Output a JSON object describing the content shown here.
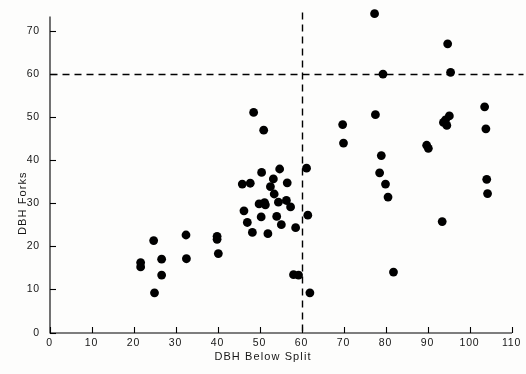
{
  "figure": {
    "background": "#fdfdfc",
    "ink": "#000000",
    "point_color": "#000000",
    "point_radius_px": 4.4
  },
  "chart_data": {
    "type": "scatter",
    "title": "",
    "xlabel": "DBH Below Split",
    "ylabel": "DBH Forks",
    "xlim": [
      0,
      110
    ],
    "ylim": [
      0,
      75
    ],
    "xticks": [
      0,
      10,
      20,
      30,
      40,
      50,
      60,
      70,
      80,
      90,
      100,
      110
    ],
    "yticks": [
      0,
      10,
      20,
      30,
      40,
      50,
      60,
      70
    ],
    "grid": false,
    "legend": "none",
    "reference_lines": [
      {
        "name": "vertical-split-line",
        "orientation": "vertical",
        "value": 60,
        "style": "dashed"
      },
      {
        "name": "horizontal-split-line",
        "orientation": "horizontal",
        "value": 60,
        "style": "dashed"
      }
    ],
    "points": [
      {
        "x": 21.7,
        "y": 16.2
      },
      {
        "x": 21.7,
        "y": 15.2
      },
      {
        "x": 24.8,
        "y": 21.3
      },
      {
        "x": 25.0,
        "y": 9.2
      },
      {
        "x": 26.7,
        "y": 17.0
      },
      {
        "x": 26.7,
        "y": 13.3
      },
      {
        "x": 32.5,
        "y": 22.6
      },
      {
        "x": 32.6,
        "y": 17.1
      },
      {
        "x": 39.9,
        "y": 22.3
      },
      {
        "x": 39.9,
        "y": 21.6
      },
      {
        "x": 40.2,
        "y": 18.3
      },
      {
        "x": 45.9,
        "y": 34.4
      },
      {
        "x": 46.3,
        "y": 28.2
      },
      {
        "x": 47.1,
        "y": 25.5
      },
      {
        "x": 47.8,
        "y": 34.6
      },
      {
        "x": 48.3,
        "y": 23.2
      },
      {
        "x": 48.6,
        "y": 51.0
      },
      {
        "x": 49.9,
        "y": 29.8
      },
      {
        "x": 50.4,
        "y": 26.8
      },
      {
        "x": 50.5,
        "y": 37.1
      },
      {
        "x": 51.0,
        "y": 46.9
      },
      {
        "x": 51.2,
        "y": 30.1
      },
      {
        "x": 51.4,
        "y": 29.6
      },
      {
        "x": 52.0,
        "y": 22.9
      },
      {
        "x": 52.6,
        "y": 33.8
      },
      {
        "x": 53.3,
        "y": 35.6
      },
      {
        "x": 53.5,
        "y": 32.1
      },
      {
        "x": 54.1,
        "y": 26.9
      },
      {
        "x": 54.5,
        "y": 30.2
      },
      {
        "x": 54.8,
        "y": 37.9
      },
      {
        "x": 55.2,
        "y": 25.0
      },
      {
        "x": 56.4,
        "y": 30.6
      },
      {
        "x": 56.6,
        "y": 34.7
      },
      {
        "x": 57.4,
        "y": 29.1
      },
      {
        "x": 58.1,
        "y": 13.4
      },
      {
        "x": 58.6,
        "y": 24.3
      },
      {
        "x": 59.3,
        "y": 13.3
      },
      {
        "x": 61.2,
        "y": 38.1
      },
      {
        "x": 61.5,
        "y": 27.2
      },
      {
        "x": 62.0,
        "y": 9.2
      },
      {
        "x": 69.8,
        "y": 48.2
      },
      {
        "x": 70.0,
        "y": 43.9
      },
      {
        "x": 77.4,
        "y": 73.9
      },
      {
        "x": 77.6,
        "y": 50.5
      },
      {
        "x": 78.6,
        "y": 37.0
      },
      {
        "x": 79.0,
        "y": 41.0
      },
      {
        "x": 79.4,
        "y": 59.9
      },
      {
        "x": 80.0,
        "y": 34.4
      },
      {
        "x": 80.6,
        "y": 31.4
      },
      {
        "x": 81.9,
        "y": 14.0
      },
      {
        "x": 89.8,
        "y": 43.4
      },
      {
        "x": 90.2,
        "y": 42.7
      },
      {
        "x": 93.5,
        "y": 25.7
      },
      {
        "x": 93.8,
        "y": 48.7
      },
      {
        "x": 94.3,
        "y": 49.3
      },
      {
        "x": 94.6,
        "y": 48.0
      },
      {
        "x": 94.8,
        "y": 66.9
      },
      {
        "x": 95.2,
        "y": 50.2
      },
      {
        "x": 95.5,
        "y": 60.3
      },
      {
        "x": 103.6,
        "y": 52.3
      },
      {
        "x": 103.9,
        "y": 47.2
      },
      {
        "x": 104.1,
        "y": 35.5
      },
      {
        "x": 104.3,
        "y": 32.2
      }
    ]
  }
}
